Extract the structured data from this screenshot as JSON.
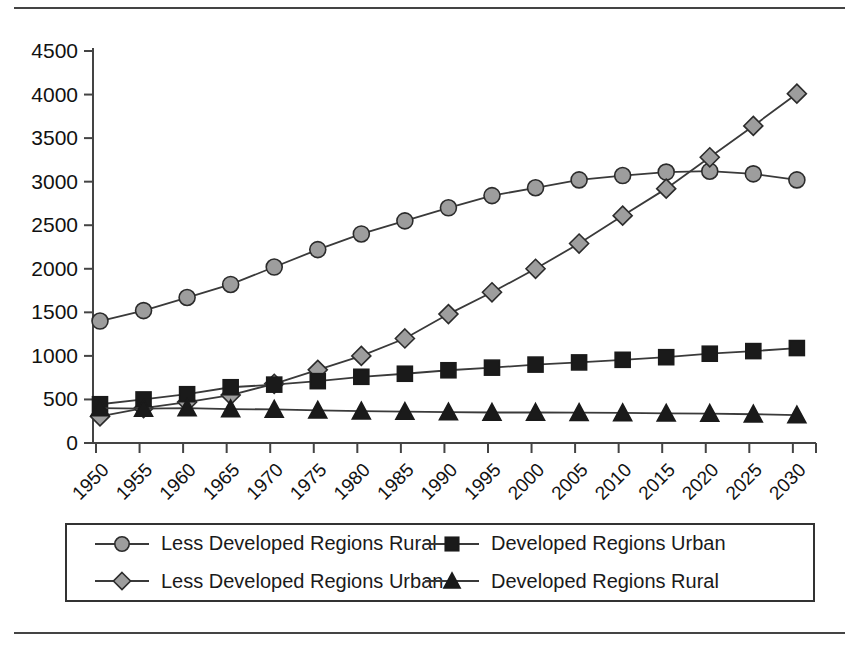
{
  "chart_data": {
    "type": "line",
    "title": "",
    "xlabel": "",
    "ylabel": "",
    "ylim": [
      0,
      4500
    ],
    "ytick_step": 500,
    "grid": false,
    "legend_position": "bottom",
    "categories": [
      "1950",
      "1955",
      "1960",
      "1965",
      "1970",
      "1975",
      "1980",
      "1985",
      "1990",
      "1995",
      "2000",
      "2005",
      "2010",
      "2015",
      "2020",
      "2025",
      "2030"
    ],
    "yticks": [
      "0",
      "500",
      "1000",
      "1500",
      "2000",
      "2500",
      "3000",
      "3500",
      "4000",
      "4500"
    ],
    "series": [
      {
        "name": "Less Developed Regions Rural",
        "marker": "circle",
        "color": "#9d9d9d",
        "line_color": "#3a3a3a",
        "values": [
          1400,
          1520,
          1670,
          1820,
          2020,
          2220,
          2400,
          2550,
          2700,
          2840,
          2930,
          3020,
          3070,
          3110,
          3120,
          3090,
          3020
        ]
      },
      {
        "name": "Less Developed Regions Urban",
        "marker": "diamond",
        "color": "#9d9d9d",
        "line_color": "#3a3a3a",
        "values": [
          305,
          400,
          470,
          550,
          680,
          840,
          1000,
          1200,
          1480,
          1730,
          2000,
          2290,
          2610,
          2920,
          3280,
          3640,
          4010
        ]
      },
      {
        "name": "Developed Regions Urban",
        "marker": "square",
        "color": "#1a1a1a",
        "line_color": "#3a3a3a",
        "values": [
          445,
          500,
          560,
          640,
          670,
          710,
          760,
          795,
          835,
          865,
          900,
          925,
          955,
          985,
          1025,
          1055,
          1090
        ]
      },
      {
        "name": "Developed Regions Rural",
        "marker": "triangle",
        "color": "#1a1a1a",
        "line_color": "#3a3a3a",
        "values": [
          400,
          395,
          400,
          390,
          385,
          375,
          365,
          360,
          355,
          350,
          350,
          348,
          345,
          340,
          338,
          330,
          320
        ]
      }
    ]
  },
  "legend": {
    "items": [
      {
        "label": "Less Developed Regions Rural",
        "marker": "circle",
        "color": "#9d9d9d"
      },
      {
        "label": "Developed Regions Urban",
        "marker": "square",
        "color": "#1a1a1a"
      },
      {
        "label": "Less Developed Regions Urban",
        "marker": "diamond",
        "color": "#9d9d9d"
      },
      {
        "label": "Developed Regions Rural",
        "marker": "triangle",
        "color": "#1a1a1a"
      }
    ]
  }
}
